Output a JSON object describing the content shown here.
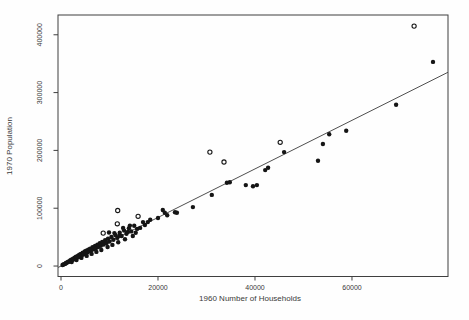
{
  "figure": {
    "background": "#fefefe",
    "frame_color": "#3f3f3f",
    "text_color": "#3a3a3a",
    "point_color": "#151515",
    "line_color": "#4f4f4f"
  },
  "chart_data": {
    "type": "scatter",
    "title": "",
    "xlabel": "1960 Number of Households",
    "ylabel": "1970 Population",
    "x_ticks": [
      0,
      20000,
      40000,
      60000
    ],
    "y_ticks": [
      0,
      100000,
      200000,
      300000,
      400000
    ],
    "xlim": [
      -620,
      79800
    ],
    "ylim": [
      -18100,
      434200
    ],
    "grid": false,
    "legend": "none",
    "regression_line": {
      "slope": 4.2,
      "intercept": 0
    },
    "series": [
      {
        "name": "towns",
        "marker": "filled-circle",
        "points": [
          [
            300,
            1800
          ],
          [
            500,
            2600
          ],
          [
            700,
            3400
          ],
          [
            900,
            4100
          ],
          [
            1000,
            5200
          ],
          [
            1200,
            5600
          ],
          [
            1400,
            6800
          ],
          [
            1500,
            7400
          ],
          [
            1700,
            7900
          ],
          [
            1900,
            9600
          ],
          [
            2000,
            8700
          ],
          [
            2100,
            11000
          ],
          [
            2200,
            7000
          ],
          [
            2300,
            10400
          ],
          [
            2500,
            12800
          ],
          [
            2600,
            11500
          ],
          [
            2800,
            14200
          ],
          [
            3000,
            13100
          ],
          [
            3100,
            16000
          ],
          [
            3200,
            10200
          ],
          [
            3300,
            14800
          ],
          [
            3500,
            17900
          ],
          [
            3600,
            15600
          ],
          [
            3800,
            19400
          ],
          [
            4000,
            17200
          ],
          [
            4100,
            21000
          ],
          [
            4200,
            14000
          ],
          [
            4300,
            18800
          ],
          [
            4500,
            23100
          ],
          [
            4600,
            21500
          ],
          [
            4700,
            20500
          ],
          [
            4900,
            25200
          ],
          [
            5000,
            22000
          ],
          [
            5200,
            26700
          ],
          [
            5300,
            17500
          ],
          [
            5400,
            23600
          ],
          [
            5500,
            26000
          ],
          [
            5600,
            28400
          ],
          [
            5800,
            25300
          ],
          [
            6000,
            30100
          ],
          [
            6200,
            27000
          ],
          [
            6300,
            21000
          ],
          [
            6500,
            32500
          ],
          [
            6700,
            28800
          ],
          [
            6800,
            31000
          ],
          [
            7000,
            34600
          ],
          [
            7200,
            30700
          ],
          [
            7300,
            24500
          ],
          [
            7500,
            37100
          ],
          [
            7700,
            32900
          ],
          [
            7800,
            36000
          ],
          [
            8000,
            39400
          ],
          [
            8200,
            35000
          ],
          [
            8300,
            27800
          ],
          [
            8500,
            41800
          ],
          [
            8800,
            37300
          ],
          [
            8900,
            41500
          ],
          [
            9100,
            44600
          ],
          [
            9400,
            39800
          ],
          [
            9600,
            33000
          ],
          [
            9700,
            47300
          ],
          [
            10000,
            42500
          ],
          [
            10400,
            50200
          ],
          [
            10600,
            36500
          ],
          [
            10800,
            45400
          ],
          [
            11000,
            57000
          ],
          [
            11200,
            53600
          ],
          [
            11600,
            48700
          ],
          [
            11800,
            41000
          ],
          [
            12000,
            52500
          ],
          [
            12100,
            57400
          ],
          [
            12500,
            52000
          ],
          [
            12800,
            66000
          ],
          [
            13000,
            61300
          ],
          [
            13200,
            46500
          ],
          [
            13500,
            55800
          ],
          [
            13800,
            59000
          ],
          [
            14000,
            65200
          ],
          [
            14200,
            70000
          ],
          [
            14500,
            59900
          ],
          [
            14800,
            52000
          ],
          [
            15100,
            69800
          ],
          [
            15400,
            57500
          ],
          [
            15700,
            64300
          ],
          [
            9900,
            58000
          ],
          [
            16300,
            66000
          ],
          [
            16900,
            76000
          ],
          [
            17300,
            71000
          ],
          [
            17900,
            76000
          ],
          [
            18400,
            80000
          ],
          [
            20000,
            83000
          ],
          [
            21000,
            97000
          ],
          [
            21400,
            92000
          ],
          [
            21900,
            88000
          ],
          [
            23500,
            93000
          ],
          [
            23900,
            92000
          ],
          [
            27200,
            102000
          ],
          [
            31100,
            123000
          ],
          [
            34200,
            144000
          ],
          [
            34800,
            145000
          ],
          [
            38100,
            140000
          ],
          [
            39600,
            138000
          ],
          [
            40400,
            140000
          ],
          [
            42100,
            166000
          ],
          [
            42700,
            170000
          ],
          [
            46000,
            197000
          ],
          [
            53000,
            182000
          ],
          [
            54000,
            211000
          ],
          [
            55300,
            228000
          ],
          [
            58800,
            234000
          ],
          [
            69100,
            279000
          ],
          [
            76700,
            353000
          ]
        ]
      },
      {
        "name": "outliers",
        "marker": "open-circle",
        "points": [
          [
            8700,
            57000
          ],
          [
            11600,
            73000
          ],
          [
            11700,
            96000
          ],
          [
            15900,
            86000
          ],
          [
            30700,
            197000
          ],
          [
            33600,
            180000
          ],
          [
            45200,
            214000
          ],
          [
            72800,
            415000
          ]
        ]
      }
    ]
  }
}
